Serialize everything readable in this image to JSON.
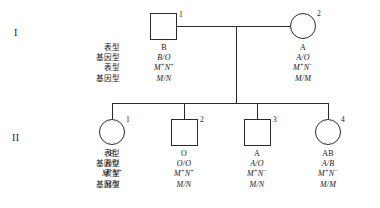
{
  "diagram": {
    "type": "pedigree-chart",
    "background_color": "#ffffff",
    "line_color": "#2a2a2a",
    "text_color": "#1a1a1a"
  },
  "generations": [
    {
      "numeral": "I",
      "row_labels": [
        "表型",
        "基因型",
        "表型",
        "基因型"
      ],
      "members": [
        {
          "index": "1",
          "sex": "male",
          "shape": "square",
          "phenotype_blood": "B",
          "genotype_blood": "B/O",
          "phenotype_mn_prefix": "M",
          "phenotype_mn_sup1": "+",
          "phenotype_mn_mid": "N",
          "phenotype_mn_sup2": "+",
          "genotype_mn": "M/N"
        },
        {
          "index": "2",
          "sex": "female",
          "shape": "circle",
          "phenotype_blood": "A",
          "genotype_blood": "A/O",
          "phenotype_mn_prefix": "M",
          "phenotype_mn_sup1": "+",
          "phenotype_mn_mid": "N",
          "phenotype_mn_sup2": "−",
          "genotype_mn": "M/M"
        }
      ]
    },
    {
      "numeral": "II",
      "row_labels": [
        "表型",
        "基因型",
        "表型",
        "基因型"
      ],
      "members": [
        {
          "index": "1",
          "sex": "female",
          "shape": "circle",
          "phenotype_blood": "B",
          "genotype_blood": "B/O",
          "phenotype_mn_prefix": "M",
          "phenotype_mn_sup1": "+",
          "phenotype_mn_mid": "N",
          "phenotype_mn_sup2": "+",
          "genotype_mn": "M/N"
        },
        {
          "index": "2",
          "sex": "male",
          "shape": "square",
          "phenotype_blood": "O",
          "genotype_blood": "O/O",
          "phenotype_mn_prefix": "M",
          "phenotype_mn_sup1": "+",
          "phenotype_mn_mid": "N",
          "phenotype_mn_sup2": "+",
          "genotype_mn": "M/N"
        },
        {
          "index": "3",
          "sex": "male",
          "shape": "square",
          "phenotype_blood": "A",
          "genotype_blood": "A/O",
          "phenotype_mn_prefix": "M",
          "phenotype_mn_sup1": "+",
          "phenotype_mn_mid": "N",
          "phenotype_mn_sup2": "−",
          "genotype_mn": "M/N"
        },
        {
          "index": "4",
          "sex": "female",
          "shape": "circle",
          "phenotype_blood": "AB",
          "genotype_blood": "A/B",
          "phenotype_mn_prefix": "M",
          "phenotype_mn_sup1": "+",
          "phenotype_mn_mid": "N",
          "phenotype_mn_sup2": "−",
          "genotype_mn": "M/M"
        }
      ]
    }
  ]
}
